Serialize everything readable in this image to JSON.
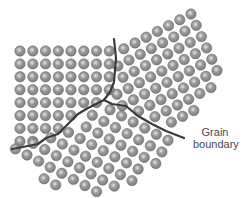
{
  "figure": {
    "atom_radius": 5.2,
    "atom_colors": {
      "base": "#7c7c7c",
      "mid": "#9a9a9a",
      "highlight": "#e6e6e6",
      "edge": "#5e5e5e"
    },
    "boundary_color": "#3a3a3a",
    "boundary_width": 2.2
  },
  "label": {
    "line1": "Grain",
    "line2": "boundary"
  },
  "grains": [
    {
      "name": "left-grain",
      "origin": [
        20,
        51
      ],
      "a": [
        12.75,
        0
      ],
      "b": [
        0,
        12.9
      ],
      "i_range": [
        0,
        8
      ],
      "j_range": [
        0,
        8
      ],
      "clip": [
        [
          12,
          44
        ],
        [
          114,
          44
        ],
        [
          116,
          60
        ],
        [
          113,
          85
        ],
        [
          104,
          101
        ],
        [
          60,
          128
        ],
        [
          40,
          140
        ],
        [
          12,
          146
        ]
      ]
    },
    {
      "name": "right-grain",
      "origin": [
        191,
        14
      ],
      "a": [
        -11.2,
        5.8
      ],
      "b": [
        5.2,
        11.3
      ],
      "i_range": [
        -2,
        10
      ],
      "j_range": [
        -2,
        12
      ],
      "clip": [
        [
          119,
          44
        ],
        [
          191,
          6
        ],
        [
          228,
          70
        ],
        [
          182,
          128
        ],
        [
          140,
          118
        ],
        [
          106,
          100
        ],
        [
          115,
          85
        ],
        [
          118,
          60
        ]
      ]
    },
    {
      "name": "bottom-grain",
      "origin": [
        27,
        155
      ],
      "a": [
        11.6,
        6.1
      ],
      "b": [
        6.1,
        -11.6
      ],
      "i_range": [
        -1,
        12
      ],
      "j_range": [
        -2,
        10
      ],
      "clip": [
        [
          12,
          150
        ],
        [
          42,
          140
        ],
        [
          62,
          129
        ],
        [
          104,
          103
        ],
        [
          140,
          120
        ],
        [
          182,
          138
        ],
        [
          140,
          180
        ],
        [
          100,
          194
        ],
        [
          60,
          190
        ],
        [
          14,
          160
        ]
      ]
    }
  ],
  "boundaries": [
    {
      "name": "boundary-vertical",
      "points": [
        [
          114,
          39
        ],
        [
          116,
          58
        ],
        [
          114,
          82
        ],
        [
          110,
          92
        ],
        [
          104,
          100
        ]
      ]
    },
    {
      "name": "boundary-left",
      "points": [
        [
          104,
          100
        ],
        [
          88,
          108
        ],
        [
          78,
          114
        ],
        [
          68,
          124
        ],
        [
          58,
          134
        ],
        [
          46,
          138
        ],
        [
          38,
          144
        ],
        [
          28,
          146
        ],
        [
          12,
          149
        ]
      ]
    },
    {
      "name": "boundary-right",
      "points": [
        [
          104,
          100
        ],
        [
          112,
          104
        ],
        [
          126,
          106
        ],
        [
          138,
          116
        ],
        [
          152,
          124
        ],
        [
          166,
          131
        ],
        [
          184,
          138
        ]
      ]
    }
  ]
}
